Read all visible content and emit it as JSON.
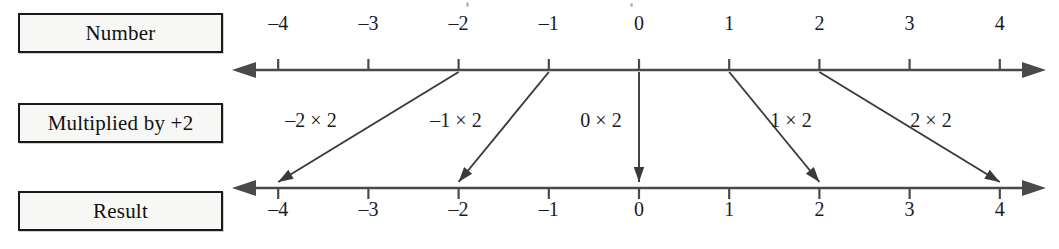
{
  "figure": {
    "type": "number-line-mapping-diagram",
    "background_color": "#ffffff",
    "line_color": "#4a4a4a",
    "arrow_color": "#3a3a3a",
    "box_border_color": "#1a1a1a",
    "box_fill_color": "#f7f7f5",
    "text_color": "#1b1b1b"
  },
  "rows": {
    "number": {
      "label": "Number"
    },
    "operation": {
      "label": "Multiplied by +2"
    },
    "result": {
      "label": "Result"
    }
  },
  "number_line_top": {
    "name": "number-line-top",
    "ticks": [
      "–4",
      "–3",
      "–2",
      "–1",
      "0",
      "1",
      "2",
      "3",
      "4"
    ],
    "values": [
      -4,
      -3,
      -2,
      -1,
      0,
      1,
      2,
      3,
      4
    ],
    "left_arrowhead": true,
    "right_arrowhead": true
  },
  "number_line_bottom": {
    "name": "number-line-result",
    "ticks": [
      "–4",
      "–3",
      "–2",
      "–1",
      "0",
      "1",
      "2",
      "3",
      "4"
    ],
    "values": [
      -4,
      -3,
      -2,
      -1,
      0,
      1,
      2,
      3,
      4
    ],
    "left_arrowhead": true,
    "right_arrowhead": true
  },
  "mappings": [
    {
      "label": "–2 × 2",
      "from_value": -2,
      "to_value": -4,
      "label_x": 311
    },
    {
      "label": "–1 × 2",
      "from_value": -1,
      "to_value": -2,
      "label_x": 456
    },
    {
      "label": "0 × 2",
      "from_value": 0,
      "to_value": 0,
      "label_x": 601
    },
    {
      "label": "1 × 2",
      "from_value": 1,
      "to_value": 2,
      "label_x": 791
    },
    {
      "label": "2 × 2",
      "from_value": 2,
      "to_value": 4,
      "label_x": 931
    }
  ],
  "chart_data": {
    "type": "line",
    "title": "",
    "xlabel": "",
    "ylabel": "",
    "categories": [
      -2,
      -1,
      0,
      1,
      2
    ],
    "series": [
      {
        "name": "Number",
        "values": [
          -2,
          -1,
          0,
          1,
          2
        ]
      },
      {
        "name": "Result (multiplied by +2)",
        "values": [
          -4,
          -2,
          0,
          2,
          4
        ]
      }
    ],
    "xlim": [
      -4,
      4
    ],
    "grid": false,
    "legend": "none"
  }
}
